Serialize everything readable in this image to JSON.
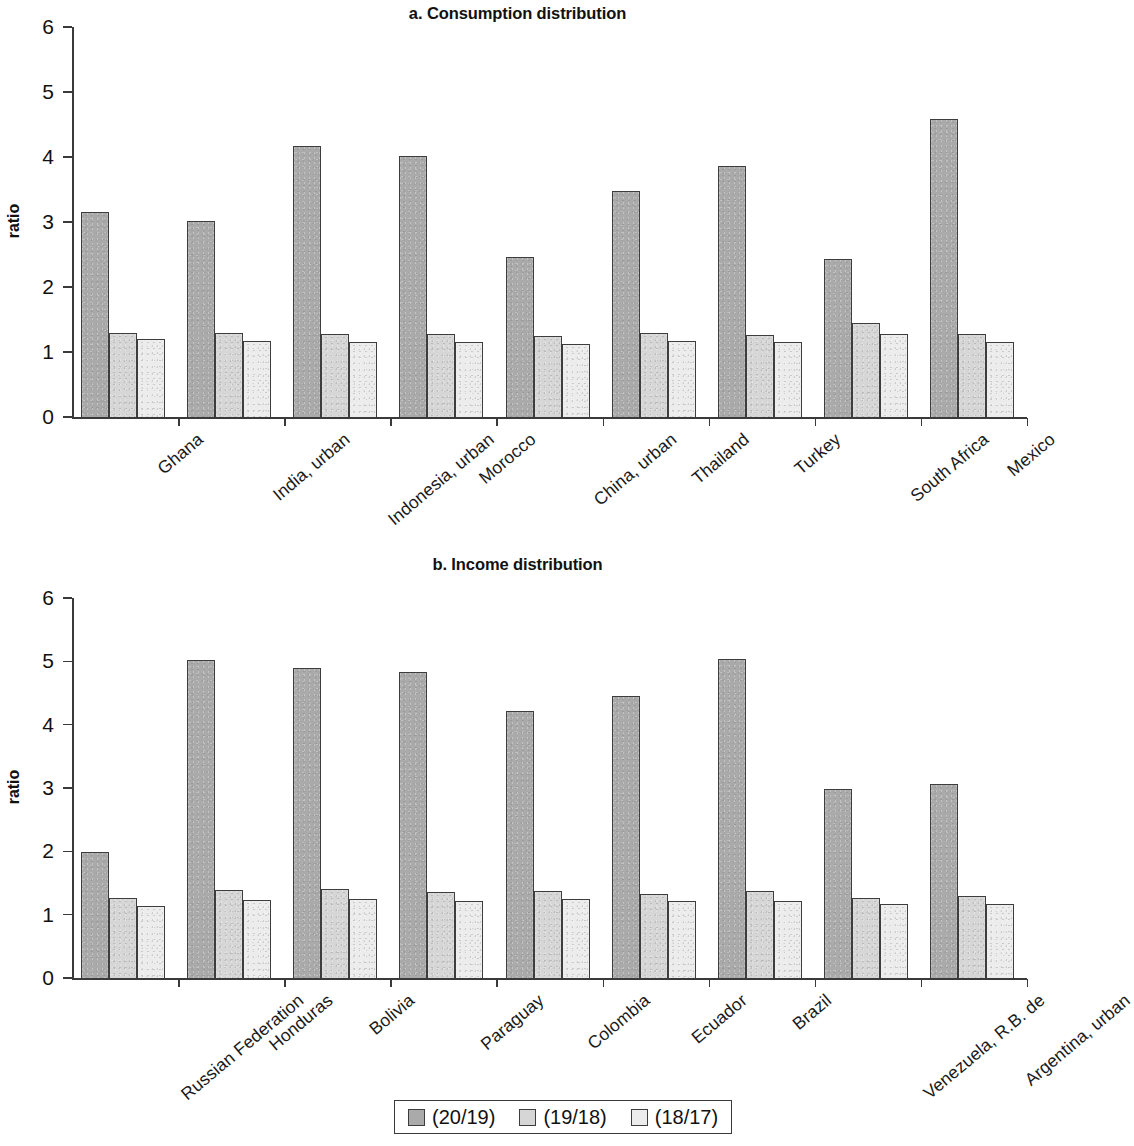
{
  "figure": {
    "legend_entries": [
      "(20/19)",
      "(19/18)",
      "(18/17)"
    ],
    "series_colors": [
      "#aaaaaa",
      "#d6d6d6",
      "#ececec"
    ]
  },
  "chart_data": [
    {
      "type": "bar",
      "title": "a. Consumption distribution",
      "xlabel": "",
      "ylabel": "ratio",
      "ylim": [
        0,
        6
      ],
      "yticks": [
        0,
        1,
        2,
        3,
        4,
        5,
        6
      ],
      "grid": false,
      "legend_position": "bottom-figure",
      "categories": [
        "Ghana",
        "India, urban",
        "Indonesia, urban",
        "Morocco",
        "China, urban",
        "Thailand",
        "Turkey",
        "South Africa",
        "Mexico"
      ],
      "series": [
        {
          "name": "(20/19)",
          "values": [
            3.15,
            3.01,
            4.17,
            4.02,
            2.46,
            3.48,
            3.86,
            2.43,
            4.58
          ]
        },
        {
          "name": "(19/18)",
          "values": [
            1.3,
            1.29,
            1.28,
            1.27,
            1.24,
            1.3,
            1.26,
            1.45,
            1.28
          ]
        },
        {
          "name": "(18/17)",
          "values": [
            1.2,
            1.17,
            1.16,
            1.15,
            1.13,
            1.17,
            1.16,
            1.28,
            1.16
          ]
        }
      ]
    },
    {
      "type": "bar",
      "title": "b. Income distribution",
      "xlabel": "",
      "ylabel": "ratio",
      "ylim": [
        0,
        6
      ],
      "yticks": [
        0,
        1,
        2,
        3,
        4,
        5,
        6
      ],
      "grid": false,
      "legend_position": "bottom-figure",
      "categories": [
        "Russian Federation",
        "Honduras",
        "Bolivia",
        "Paraguay",
        "Colombia",
        "Ecuador",
        "Brazil",
        "Venezuela, R.B. de",
        "Argentina, urban"
      ],
      "series": [
        {
          "name": "(20/19)",
          "values": [
            1.99,
            5.02,
            4.9,
            4.83,
            4.21,
            4.46,
            5.03,
            2.98,
            3.06
          ]
        },
        {
          "name": "(19/18)",
          "values": [
            1.26,
            1.39,
            1.4,
            1.36,
            1.37,
            1.33,
            1.38,
            1.27,
            1.3
          ]
        },
        {
          "name": "(18/17)",
          "values": [
            1.14,
            1.23,
            1.24,
            1.21,
            1.24,
            1.21,
            1.22,
            1.17,
            1.17
          ]
        }
      ]
    }
  ]
}
